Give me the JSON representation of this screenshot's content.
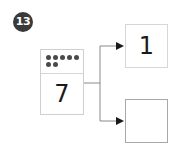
{
  "problem": {
    "number": "13"
  },
  "source": {
    "dots_row1": 5,
    "dots_row2": 2,
    "value": "7"
  },
  "outputs": [
    {
      "value": "1"
    },
    {
      "value": ""
    }
  ],
  "colors": {
    "badge": "#3a3a3a",
    "dot": "#4a4a4a",
    "line": "#8a8a8a",
    "arrow": "#1a1a1a"
  }
}
